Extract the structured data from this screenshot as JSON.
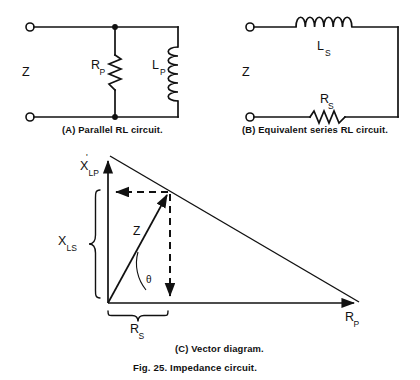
{
  "figure": {
    "number_caption": "Fig. 25. Impedance circuit.",
    "panels": [
      {
        "id": "A",
        "caption": "(A)  Parallel RL circuit."
      },
      {
        "id": "B",
        "caption": "(B)  Equivalent series RL circuit."
      },
      {
        "id": "C",
        "caption": "(C)  Vector diagram."
      }
    ]
  },
  "circuit_a": {
    "impedance_label": "Z",
    "resistor": {
      "symbol": "R",
      "subscript": "P",
      "type": "resistor-zigzag-vertical"
    },
    "inductor": {
      "symbol": "L",
      "subscript": "P",
      "type": "inductor-coil-vertical"
    },
    "terminals": 2,
    "nodes": 2
  },
  "circuit_b": {
    "impedance_label": "Z",
    "inductor": {
      "symbol": "L",
      "subscript": "S",
      "type": "inductor-coil-horizontal"
    },
    "resistor": {
      "symbol": "R",
      "subscript": "S",
      "type": "resistor-zigzag-horizontal"
    },
    "terminals": 2
  },
  "vector_diagram": {
    "angle_label": "θ",
    "impedance_vector_label": "Z",
    "vertical_axis": {
      "symbol": "X",
      "subscript": "LP",
      "prime": "'"
    },
    "reactance_brace": {
      "symbol": "X",
      "subscript": "LS"
    },
    "resistance_brace": {
      "symbol": "R",
      "subscript": "S"
    },
    "horizontal_axis": {
      "symbol": "R",
      "subscript": "P"
    }
  },
  "colors": {
    "ink": "#111111",
    "paper": "#ffffff"
  }
}
